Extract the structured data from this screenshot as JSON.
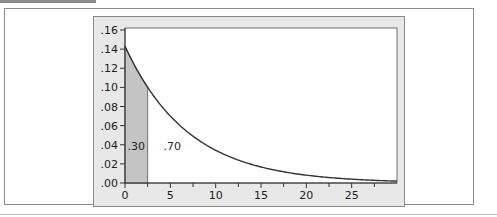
{
  "chart_data": {
    "type": "area",
    "title": "",
    "xlabel": "",
    "ylabel": "",
    "function": "f(x) = 0.143 * exp(-0.143 x)",
    "rate": 0.143,
    "xlim": [
      0,
      30
    ],
    "ylim": [
      0,
      0.16
    ],
    "x_ticks": [
      0,
      5,
      10,
      15,
      20,
      25
    ],
    "x_tick_labels": [
      "0",
      "5",
      "10",
      "15",
      "20",
      "25"
    ],
    "x_minor_ticks": [
      2.5,
      7.5,
      12.5,
      17.5,
      22.5,
      27.5
    ],
    "y_ticks": [
      0,
      0.02,
      0.04,
      0.06,
      0.08,
      0.1,
      0.12,
      0.14,
      0.16
    ],
    "y_tick_labels": [
      ".00",
      ".02",
      ".04",
      ".06",
      ".08",
      ".10",
      ".12",
      ".14",
      ".16"
    ],
    "x": [
      0,
      2.5,
      5,
      10,
      15,
      20,
      25,
      30
    ],
    "values": [
      0.143,
      0.1,
      0.07,
      0.034,
      0.017,
      0.008,
      0.004,
      0.002
    ],
    "shaded_region": {
      "from": 0,
      "to": 2.5,
      "color": "#c4c4c4"
    },
    "annotations": [
      {
        "text": ".30",
        "region": "left shaded area"
      },
      {
        "text": ".70",
        "region": "right unshaded area"
      }
    ],
    "grid": false,
    "legend": null
  },
  "colors": {
    "curve": "#333333",
    "shade": "#c4c4c4",
    "panel": "#e8e8e8",
    "plot_bg": "#ffffff",
    "frame": "#8a8a8a"
  }
}
